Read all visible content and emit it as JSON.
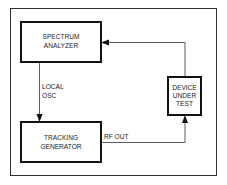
{
  "diagram": {
    "type": "block-diagram",
    "blocks": [
      {
        "id": "spectrum_analyzer",
        "lines": [
          "SPECTRUM",
          "ANALYZER"
        ]
      },
      {
        "id": "tracking_generator",
        "lines": [
          "TRACKING",
          "GENERATOR"
        ]
      },
      {
        "id": "device_under_test",
        "lines": [
          "DEVICE",
          "UNDER",
          "TEST"
        ]
      }
    ],
    "connections": [
      {
        "from": "spectrum_analyzer",
        "to": "tracking_generator",
        "label_lines": [
          "LOCAL",
          "OSC"
        ]
      },
      {
        "from": "tracking_generator",
        "to": "device_under_test",
        "label": "RF OUT"
      },
      {
        "from": "device_under_test",
        "to": "spectrum_analyzer",
        "label": ""
      }
    ]
  }
}
